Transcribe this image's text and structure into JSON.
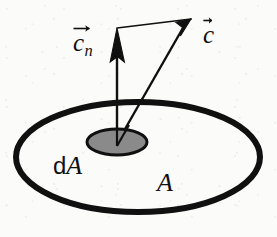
{
  "figure": {
    "kind": "physics-vector-diagram",
    "caption_subject": "velocity vector and its normal component through an area element",
    "background_color": "#fbfbfa",
    "ink_color": "#101010",
    "patch_fill_color": "#8a8a8a"
  },
  "labels": {
    "normal_vector": {
      "symbol": "c",
      "subscript": "n",
      "overbar_icon": "vector-arrow-overbar",
      "full_text": "c_n"
    },
    "velocity_vector": {
      "symbol": "c",
      "subscript": "",
      "overbar_icon": "vector-arrow-overbar",
      "full_text": "c"
    },
    "area_element": {
      "prefix": "d",
      "symbol": "A",
      "full_text": "dA"
    },
    "area": {
      "symbol": "A",
      "full_text": "A"
    }
  },
  "shapes": {
    "outer_ellipse": {
      "name": "area-A-boundary",
      "cx": 138,
      "cy": 157,
      "rx": 122,
      "ry": 55,
      "stroke_width": 6,
      "fill": "none"
    },
    "inner_ellipse": {
      "name": "area-element-dA-patch",
      "cx": 117,
      "cy": 142,
      "rx": 30,
      "ry": 13,
      "stroke_width": 3,
      "fill": "#8a8a8a"
    }
  },
  "vectors": {
    "origin": {
      "x": 117,
      "y": 143
    },
    "normal": {
      "name": "normal-component-arrow",
      "tip_x": 117,
      "tip_y": 28,
      "shaft_width": 2.4,
      "head_length": 34,
      "head_half_width": 8
    },
    "velocity": {
      "name": "velocity-arrow",
      "tip_x": 191,
      "tip_y": 19,
      "shaft_width": 2.4,
      "head_length": 38,
      "head_half_width": 8.5
    },
    "connector": {
      "name": "projection-construction-line",
      "from_x": 117,
      "from_y": 28,
      "to_x": 191,
      "to_y": 19,
      "stroke_width": 1.7
    }
  }
}
